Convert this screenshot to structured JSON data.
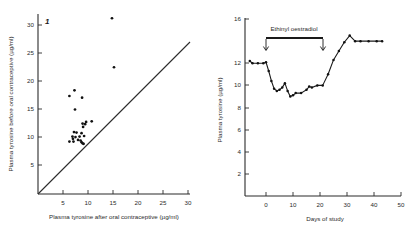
{
  "figure": {
    "panel_tag": "1"
  },
  "chart_data": [
    {
      "type": "scatter",
      "panel": "1",
      "title": "",
      "xlabel": "Plasma tyrosine after oral contraceptive (µg/ml)",
      "ylabel": "Plasma tyrosine before oral contraceptive (µg/ml)",
      "xlim": [
        0,
        32
      ],
      "ylim": [
        0,
        32
      ],
      "xticks": [
        5,
        10,
        15,
        20,
        25,
        30
      ],
      "yticks": [
        5,
        10,
        15,
        20,
        25,
        30
      ],
      "grid": false,
      "legend": "none",
      "reference_line": {
        "name": "line-of-identity",
        "from": [
          0,
          0
        ],
        "to": [
          30,
          30
        ]
      },
      "points": [
        [
          14.6,
          31.2
        ],
        [
          15.0,
          22.5
        ],
        [
          6.2,
          17.4
        ],
        [
          7.2,
          18.4
        ],
        [
          8.7,
          17.1
        ],
        [
          7.3,
          15.0
        ],
        [
          9.5,
          12.8
        ],
        [
          10.6,
          12.9
        ],
        [
          8.8,
          12.5
        ],
        [
          9.3,
          12.4
        ],
        [
          8.9,
          11.9
        ],
        [
          7.1,
          11.0
        ],
        [
          7.6,
          10.9
        ],
        [
          8.6,
          10.8
        ],
        [
          6.8,
          10.2
        ],
        [
          7.4,
          10.1
        ],
        [
          8.2,
          10.2
        ],
        [
          9.1,
          10.3
        ],
        [
          6.9,
          9.8
        ],
        [
          7.9,
          9.6
        ],
        [
          8.4,
          9.5
        ],
        [
          6.2,
          9.3
        ],
        [
          7.0,
          9.3
        ],
        [
          8.6,
          9.2
        ],
        [
          8.8,
          9.0
        ],
        [
          9.0,
          8.9
        ]
      ]
    },
    {
      "type": "line",
      "title": "",
      "xlabel": "Days of study",
      "ylabel": "Plasma tyrosine (µg/ml)",
      "xlim": [
        -8,
        50
      ],
      "ylim": [
        0,
        16
      ],
      "xticks": [
        0,
        10,
        20,
        30,
        40,
        50
      ],
      "yticks": [
        2,
        4,
        6,
        8,
        10,
        12,
        16
      ],
      "grid": false,
      "legend": "none",
      "annotation": {
        "label": "Ethinyl oestradiol",
        "treatment_start_day": 0,
        "treatment_end_day": 21
      },
      "series": [
        {
          "name": "Plasma tyrosine",
          "x": [
            -6,
            -5,
            -3,
            -1,
            0,
            1,
            2,
            3,
            4,
            5,
            6,
            7,
            8,
            9,
            10,
            11,
            13,
            15,
            16,
            17,
            19,
            21,
            23,
            25,
            27,
            29,
            31,
            33,
            35,
            38,
            41,
            43
          ],
          "y": [
            12.2,
            12.0,
            12.0,
            12.0,
            12.1,
            11.3,
            10.4,
            9.7,
            9.5,
            9.6,
            9.8,
            10.2,
            9.5,
            9.0,
            9.1,
            9.3,
            9.3,
            9.6,
            9.9,
            9.8,
            10.0,
            10.0,
            11.0,
            12.3,
            13.1,
            13.9,
            14.5,
            14.0,
            14.0,
            14.0,
            14.0,
            14.0
          ]
        }
      ]
    }
  ]
}
